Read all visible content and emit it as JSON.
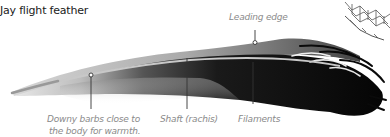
{
  "title": "Jay flight feather",
  "labels": {
    "leading_edge": "Leading edge",
    "downy_barbs_line1": "Downy barbs close to",
    "downy_barbs_line2": "the body for warmth.",
    "shaft": "Shaft (rachis)",
    "filaments": "Filaments"
  },
  "colors": {
    "label_text": "#8a8a8a",
    "title_text": "#1a1a1a",
    "feather_dark": "#0a0a0a",
    "leader_line": "#333333"
  }
}
